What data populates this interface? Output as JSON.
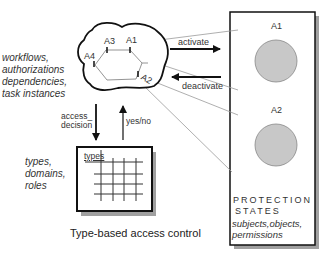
{
  "cloud": {
    "nodes": [
      "A1",
      "A2",
      "A3",
      "A4"
    ],
    "description_lines": [
      "workflows,",
      "authorizations",
      "dependencies,",
      "task instances"
    ]
  },
  "arrows": {
    "activate": "activate",
    "deactivate": "deactivate",
    "access_decision_lines": [
      "access_",
      "decision"
    ],
    "yes_no": "yes/no"
  },
  "matrix": {
    "header_label": "types",
    "description_lines": [
      "types,",
      "domains,",
      "roles"
    ],
    "caption": "Type-based access control"
  },
  "protection_box": {
    "states": [
      "A1",
      "A2"
    ],
    "title_lines": [
      "PROTECTION",
      "STATES"
    ],
    "subtitle_lines": [
      "subjects,objects,",
      "permissions"
    ]
  },
  "colors": {
    "circle_fill": "#c8c8c8",
    "line_gray": "#9a9a9a",
    "shadow": "#9e9e9e"
  }
}
